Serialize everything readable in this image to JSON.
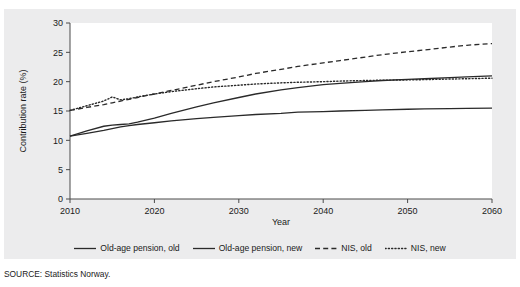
{
  "source_note": "SOURCE: Statistics Norway.",
  "legend": {
    "entries": [
      {
        "label": "Old-age pension, old",
        "style": "solid",
        "key": "oldage_old"
      },
      {
        "label": "Old-age pension, new",
        "style": "solid",
        "key": "oldage_new"
      },
      {
        "label": "NIS, old",
        "style": "dashed",
        "key": "nis_old"
      },
      {
        "label": "NIS, new",
        "style": "dotted",
        "key": "nis_new"
      }
    ]
  },
  "chart_data": {
    "type": "line",
    "title": "",
    "xlabel": "Year",
    "ylabel": "Contribution rate (%)",
    "xlim": [
      2010,
      2060
    ],
    "ylim": [
      0,
      30
    ],
    "xticks": [
      2010,
      2020,
      2030,
      2040,
      2050,
      2060
    ],
    "yticks": [
      0,
      5,
      10,
      15,
      20,
      25,
      30
    ],
    "grid": false,
    "legend_position": "bottom",
    "x": [
      2010,
      2012,
      2014,
      2015,
      2016,
      2017,
      2018,
      2020,
      2022,
      2025,
      2027,
      2030,
      2032,
      2035,
      2037,
      2040,
      2042,
      2045,
      2047,
      2050,
      2052,
      2055,
      2057,
      2060
    ],
    "series": [
      {
        "name": "Old-age pension, old",
        "style": "solid",
        "color": "#2a2a2a",
        "values": [
          10.7,
          11.2,
          11.7,
          12.0,
          12.3,
          12.5,
          12.7,
          13.0,
          13.3,
          13.7,
          13.9,
          14.2,
          14.4,
          14.6,
          14.8,
          14.9,
          15.0,
          15.1,
          15.2,
          15.3,
          15.35,
          15.4,
          15.45,
          15.5
        ]
      },
      {
        "name": "Old-age pension, new",
        "style": "solid",
        "color": "#2a2a2a",
        "values": [
          10.7,
          11.6,
          12.4,
          12.6,
          12.7,
          12.8,
          13.1,
          13.8,
          14.6,
          15.7,
          16.4,
          17.3,
          17.9,
          18.6,
          19.0,
          19.5,
          19.7,
          20.0,
          20.2,
          20.4,
          20.5,
          20.7,
          20.8,
          21.0
        ]
      },
      {
        "name": "NIS, old",
        "style": "dashed",
        "color": "#2a2a2a",
        "values": [
          15.1,
          15.6,
          16.1,
          16.4,
          16.7,
          17.0,
          17.3,
          17.9,
          18.5,
          19.4,
          20.0,
          20.8,
          21.4,
          22.1,
          22.6,
          23.2,
          23.6,
          24.2,
          24.6,
          25.1,
          25.4,
          25.9,
          26.2,
          26.5
        ]
      },
      {
        "name": "NIS, new",
        "style": "dotted",
        "color": "#2a2a2a",
        "values": [
          15.1,
          15.9,
          16.7,
          17.4,
          16.9,
          17.1,
          17.4,
          17.9,
          18.3,
          18.8,
          19.1,
          19.4,
          19.6,
          19.8,
          19.9,
          20.0,
          20.1,
          20.2,
          20.25,
          20.3,
          20.35,
          20.45,
          20.5,
          20.6
        ]
      }
    ]
  }
}
